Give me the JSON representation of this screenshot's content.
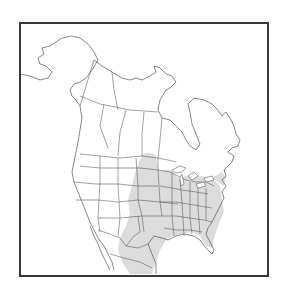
{
  "map": {
    "title": "Species range map",
    "region": "North America",
    "colors": {
      "background": "#ffffff",
      "frame": "#3a3a3a",
      "boundary": "#555555",
      "range_fill": "#dcdcdc",
      "land": "#ffffff"
    },
    "legend": [],
    "range_description": "Central and eastern United States from the Dakotas and Great Lakes south to the Gulf Coast and Florida, extending into northeastern Mexico"
  }
}
